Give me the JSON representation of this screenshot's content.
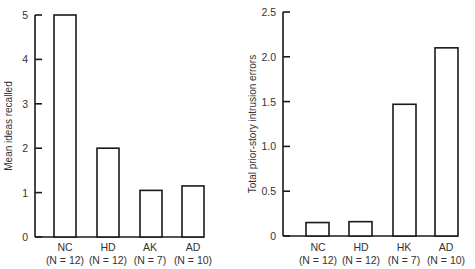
{
  "chart_data": [
    {
      "type": "bar",
      "title": "",
      "xlabel": "",
      "ylabel": "Mean ideas recalled",
      "ylim": [
        0,
        5
      ],
      "yticks": [
        "0",
        "1",
        "2",
        "3",
        "4",
        "5"
      ],
      "ytick_values": [
        0,
        1,
        2,
        3,
        4,
        5
      ],
      "grid": false,
      "categories": [
        "NC",
        "HD",
        "AK",
        "AD"
      ],
      "category_sublabels": [
        "(N = 12)",
        "(N = 12)",
        "(N = 7)",
        "(N = 10)"
      ],
      "values": [
        5.0,
        2.0,
        1.05,
        1.15
      ],
      "bar_fill": "#ffffff",
      "bar_stroke": "#1a1a1a"
    },
    {
      "type": "bar",
      "title": "",
      "xlabel": "",
      "ylabel": "Total prior-story intrusion errors",
      "ylim": [
        0,
        2.5
      ],
      "yticks": [
        "0",
        "0.5",
        "1.0",
        "1.5",
        "2.0",
        "2.5"
      ],
      "ytick_values": [
        0,
        0.5,
        1.0,
        1.5,
        2.0,
        2.5
      ],
      "grid": false,
      "categories": [
        "NC",
        "HD",
        "HK",
        "AD"
      ],
      "category_sublabels": [
        "(N = 12)",
        "(N = 12)",
        "(N = 7)",
        "(N = 10)"
      ],
      "values": [
        0.15,
        0.16,
        1.47,
        2.1
      ],
      "bar_fill": "#ffffff",
      "bar_stroke": "#1a1a1a"
    }
  ]
}
